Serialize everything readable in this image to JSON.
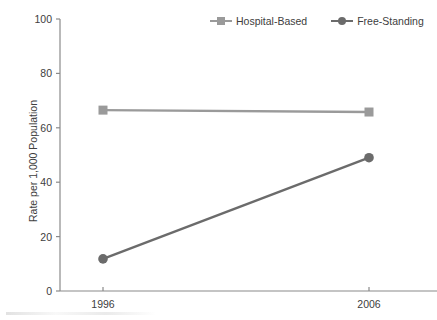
{
  "chart_data": {
    "type": "line",
    "title": "",
    "subtitle": "",
    "xlabel": "",
    "ylabel": "Rate per 1,000 Population",
    "categories": [
      "1996",
      "2006"
    ],
    "x_tick_labels": [
      "1996",
      "2006"
    ],
    "y_tick_labels": [
      "0",
      "20",
      "40",
      "60",
      "80",
      "100"
    ],
    "y_ticks": [
      0,
      20,
      40,
      60,
      80,
      100
    ],
    "ylim": [
      0,
      100
    ],
    "grid": false,
    "legend_position": "top-right",
    "series": [
      {
        "name": "Hospital-Based",
        "values": [
          66.5,
          65.8
        ],
        "color": "#9a9a9a",
        "marker": "square"
      },
      {
        "name": "Free-Standing",
        "values": [
          11.8,
          49.0
        ],
        "color": "#6b6b6b",
        "marker": "circle"
      }
    ]
  },
  "legend": {
    "items": [
      {
        "label": "Hospital-Based"
      },
      {
        "label": "Free-Standing"
      }
    ]
  },
  "axes": {
    "y_title": "Rate per 1,000 Population",
    "y_labels": [
      "100",
      "80",
      "60",
      "40",
      "20",
      "0"
    ],
    "x_labels": [
      "1996",
      "2006"
    ]
  },
  "colors": {
    "hospital_based": "#9a9a9a",
    "free_standing": "#6b6b6b",
    "axis": "#8a8a8a",
    "text": "#404040",
    "background": "#ffffff"
  }
}
